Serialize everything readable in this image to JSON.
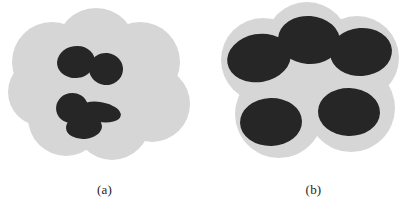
{
  "figure": {
    "background_color": "#ffffff",
    "cloud_color": "#d6d6d6",
    "cloud_edge_color": "#cccccc",
    "blob_color": "#262626",
    "caption_color": "#1d1d1d",
    "panel_count": 2
  },
  "panels": [
    {
      "id": "a",
      "caption": "(a)",
      "description": "light gray cloud region containing two small clusters of dark blobs",
      "cloud": {
        "shape": "union-of-circles",
        "circles": [
          {
            "cx": 52,
            "cy": 62,
            "r": 40
          },
          {
            "cx": 96,
            "cy": 48,
            "r": 40
          },
          {
            "cx": 140,
            "cy": 62,
            "r": 40
          },
          {
            "cx": 152,
            "cy": 104,
            "r": 38
          },
          {
            "cx": 112,
            "cy": 122,
            "r": 38
          },
          {
            "cx": 66,
            "cy": 118,
            "r": 38
          },
          {
            "cx": 42,
            "cy": 92,
            "r": 34
          },
          {
            "cx": 100,
            "cy": 85,
            "r": 46
          }
        ]
      },
      "blob_groups": [
        {
          "name": "upper-cluster",
          "blob_count": 2,
          "blobs": [
            {
              "cx": 76,
              "cy": 62,
              "rx": 19,
              "ry": 16,
              "rot": -8
            },
            {
              "cx": 106,
              "cy": 69,
              "rx": 17,
              "ry": 16,
              "rot": 6
            }
          ]
        },
        {
          "name": "lower-cluster",
          "blob_count": 3,
          "blobs": [
            {
              "cx": 72,
              "cy": 108,
              "rx": 16,
              "ry": 15,
              "rot": -12
            },
            {
              "cx": 100,
              "cy": 112,
              "rx": 21,
              "ry": 10,
              "rot": 10
            },
            {
              "cx": 84,
              "cy": 127,
              "rx": 18,
              "ry": 12,
              "rot": -4
            }
          ]
        }
      ]
    },
    {
      "id": "b",
      "caption": "(b)",
      "description": "light gray cloud region containing five large dark elliptical blobs",
      "cloud": {
        "shape": "union-of-circles",
        "circles": [
          {
            "cx": 54,
            "cy": 60,
            "r": 42
          },
          {
            "cx": 98,
            "cy": 44,
            "r": 42
          },
          {
            "cx": 148,
            "cy": 58,
            "r": 42
          },
          {
            "cx": 142,
            "cy": 108,
            "r": 44
          },
          {
            "cx": 70,
            "cy": 114,
            "r": 44
          },
          {
            "cx": 100,
            "cy": 82,
            "r": 48
          }
        ]
      },
      "blob_groups": [
        {
          "name": "large-blobs",
          "blob_count": 5,
          "blobs": [
            {
              "cx": 50,
              "cy": 58,
              "rx": 32,
              "ry": 24,
              "rot": -10
            },
            {
              "cx": 100,
              "cy": 40,
              "rx": 31,
              "ry": 24,
              "rot": 4
            },
            {
              "cx": 152,
              "cy": 52,
              "rx": 31,
              "ry": 24,
              "rot": -4
            },
            {
              "cx": 140,
              "cy": 112,
              "rx": 31,
              "ry": 24,
              "rot": 2
            },
            {
              "cx": 62,
              "cy": 122,
              "rx": 31,
              "ry": 24,
              "rot": -2
            }
          ]
        }
      ]
    }
  ]
}
